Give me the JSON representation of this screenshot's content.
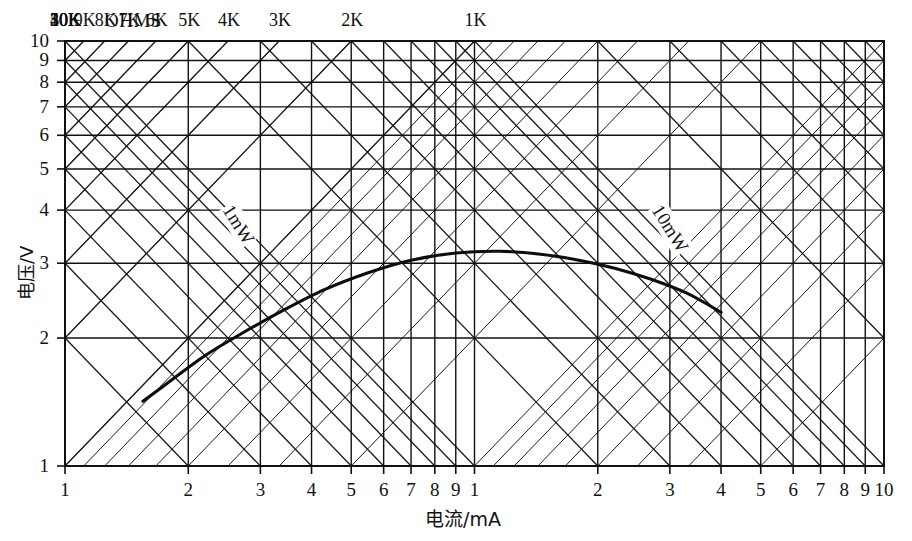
{
  "chart_data": {
    "type": "line",
    "title": "",
    "xlabel": "电流/mA",
    "ylabel": "电压/V",
    "xscale": "log",
    "yscale": "log",
    "xlim": [
      1,
      100
    ],
    "ylim": [
      1,
      10
    ],
    "grid": true,
    "legend": "none",
    "x_tick_labels": [
      "1",
      "2",
      "3",
      "4",
      "5",
      "6",
      "7",
      "8",
      "9",
      "1",
      "2",
      "3",
      "4",
      "5",
      "6",
      "7",
      "8",
      "9",
      "10"
    ],
    "x_tick_values": [
      1,
      2,
      3,
      4,
      5,
      6,
      7,
      8,
      9,
      10,
      20,
      30,
      40,
      50,
      60,
      70,
      80,
      90,
      100
    ],
    "y_tick_labels": [
      "1",
      "2",
      "3",
      "4",
      "5",
      "6",
      "7",
      "8",
      "9",
      "10"
    ],
    "y_tick_values": [
      1,
      2,
      3,
      4,
      5,
      6,
      7,
      8,
      9,
      10
    ],
    "resistance_header": "OHMS",
    "resistance_lines": [
      {
        "label": "50K",
        "ohms": 50000
      },
      {
        "label": "40K",
        "ohms": 40000
      },
      {
        "label": "30K",
        "ohms": 30000
      },
      {
        "label": "20K",
        "ohms": 20000
      },
      {
        "label": "10K",
        "ohms": 10000
      },
      {
        "label": "9K",
        "ohms": 9000
      },
      {
        "label": "8K",
        "ohms": 8000
      },
      {
        "label": "7K",
        "ohms": 7000
      },
      {
        "label": "6K",
        "ohms": 6000
      },
      {
        "label": "5K",
        "ohms": 5000
      },
      {
        "label": "4K",
        "ohms": 4000
      },
      {
        "label": "3K",
        "ohms": 3000
      },
      {
        "label": "2K",
        "ohms": 2000
      },
      {
        "label": "1K",
        "ohms": 1000
      }
    ],
    "power_lines": [
      {
        "label": "1mW",
        "milliwatts": 1
      },
      {
        "label": "10mW",
        "milliwatts": 10
      }
    ],
    "series": [
      {
        "name": "curve",
        "x": [
          1.55,
          1.8,
          2.2,
          2.7,
          3.4,
          4.3,
          5.5,
          7.0,
          9.0,
          11.5,
          14.5,
          18.0,
          22.0,
          27.0,
          33.0,
          40.0
        ],
        "y": [
          1.42,
          1.58,
          1.82,
          2.05,
          2.32,
          2.6,
          2.85,
          3.05,
          3.17,
          3.2,
          3.15,
          3.05,
          2.92,
          2.75,
          2.55,
          2.3
        ]
      }
    ]
  },
  "axes": {
    "y_title": "电压/V",
    "x_title": "电流/mA"
  }
}
